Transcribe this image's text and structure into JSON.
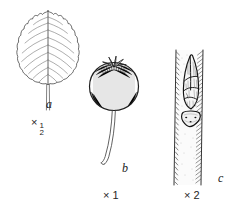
{
  "plate": {
    "kind": "botanical-line-illustration",
    "background_color": "#ffffff",
    "ink_color": "#1a1a1a",
    "width": 242,
    "height": 220
  },
  "figures": [
    {
      "id": "a",
      "label": "a",
      "subject": "leaf",
      "description": "Ovate-elliptic leaf with acuminate apex, crenate-serrate margin, prominent midrib, about nine pairs of straight parallel lateral veins, and a long slender petiole",
      "scale": {
        "times": "×",
        "whole": "",
        "numerator": "1",
        "denominator": "2",
        "text": "×½"
      }
    },
    {
      "id": "b",
      "label": "b",
      "subject": "fruit",
      "description": "Globose pome-like fruit with persistent spreading calyx lobes at the apex, finely hatched surface shading, borne on a long slender curving stalk",
      "scale": {
        "times": "×",
        "whole": "1",
        "numerator": "",
        "denominator": "",
        "text": "× 1"
      }
    },
    {
      "id": "c",
      "label": "c",
      "subject": "twig-with-bud",
      "description": "Portion of twig bearing a narrow pointed lateral bud of overlapping imbricate scales above a shield-shaped leaf scar with three bundle traces; twig surface stippled and shaded along both margins",
      "scale": {
        "times": "×",
        "whole": "2",
        "numerator": "",
        "denominator": "",
        "text": "× 2"
      }
    }
  ]
}
